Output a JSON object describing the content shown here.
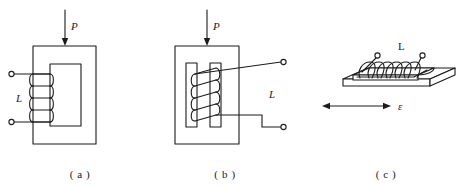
{
  "figure": {
    "kind": "technical-line-diagram",
    "background_color": "#ffffff",
    "line_color": "#1b1b1b",
    "panels": [
      {
        "id": "a",
        "caption": "( a )",
        "force_label": "P",
        "coil_label": "L",
        "coil_turns": 5,
        "terminal_count": 2,
        "core_shape": "rectangular-window-frame",
        "coil_position": "left-leg"
      },
      {
        "id": "b",
        "caption": "( b )",
        "force_label": "P",
        "coil_label": "L",
        "coil_turns": 5,
        "terminal_count": 2,
        "core_shape": "rectangular-frame-with-two-inner-bars",
        "coil_position": "between-inner-bars"
      },
      {
        "id": "c",
        "caption": "( c )",
        "strain_label": "ε",
        "coil_label": "L",
        "coil_turns": 7,
        "terminal_count": 2,
        "core_shape": "flat-plate-with-elongated-core",
        "coil_position": "on-surface-core",
        "arrow_type": "double-headed-horizontal"
      }
    ]
  }
}
